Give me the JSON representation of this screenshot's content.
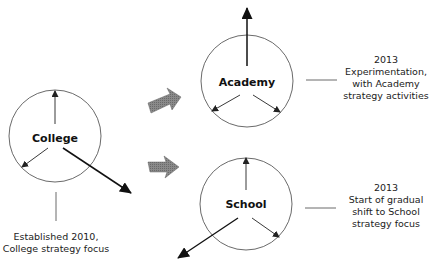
{
  "nodes": {
    "college": {
      "label": "College"
    },
    "academy": {
      "label": "Academy"
    },
    "school": {
      "label": "School"
    }
  },
  "annotations": {
    "college": {
      "line1": "Established 2010,",
      "line2": "College strategy focus"
    },
    "academy": {
      "line1": "2013",
      "line2": "Experimentation,",
      "line3": "with Academy",
      "line4": "strategy activities"
    },
    "school": {
      "line1": "2013",
      "line2": "Start of gradual",
      "line3": "shift to School",
      "line4": "strategy focus"
    }
  },
  "colors": {
    "stroke": "#222222",
    "block_arrow": "#7a7a7a"
  }
}
